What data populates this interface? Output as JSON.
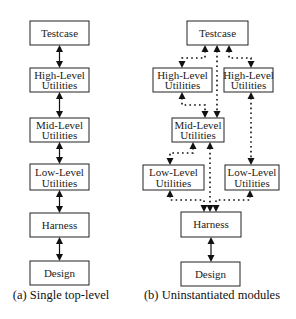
{
  "diagram_a": {
    "caption": "(a) Single top-level",
    "boxes": [
      {
        "id": "testcase",
        "line1": "Testcase",
        "line2": ""
      },
      {
        "id": "high",
        "line1": "High-Level",
        "line2": "Utilities"
      },
      {
        "id": "mid",
        "line1": "Mid-Level",
        "line2": "Utilities"
      },
      {
        "id": "low",
        "line1": "Low-Level",
        "line2": "Utilities"
      },
      {
        "id": "harness",
        "line1": "Harness",
        "line2": ""
      },
      {
        "id": "design",
        "line1": "Design",
        "line2": ""
      }
    ],
    "connector_style": "solid bidirectional arrows"
  },
  "diagram_b": {
    "caption": "(b) Uninstantiated modules",
    "boxes": [
      {
        "id": "testcase",
        "line1": "Testcase",
        "line2": ""
      },
      {
        "id": "high_left",
        "line1": "High-Level",
        "line2": "Utilities"
      },
      {
        "id": "high_right",
        "line1": "High-Level",
        "line2": "Utilities"
      },
      {
        "id": "mid",
        "line1": "Mid-Level",
        "line2": "Utilities"
      },
      {
        "id": "low_left",
        "line1": "Low-Level",
        "line2": "Utilities"
      },
      {
        "id": "low_right",
        "line1": "Low-Level",
        "line2": "Utilities"
      },
      {
        "id": "harness",
        "line1": "Harness",
        "line2": ""
      },
      {
        "id": "design",
        "line1": "Design",
        "line2": ""
      }
    ],
    "connector_style": "dotted arrows (uninstantiated), solid between Harness and Design"
  }
}
